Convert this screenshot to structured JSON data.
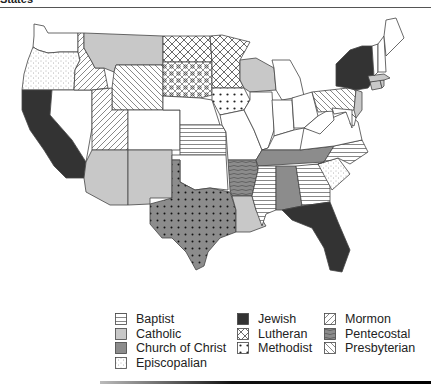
{
  "page": {
    "caption_fragment": "States"
  },
  "colors": {
    "Baptist": "#ffffff",
    "Catholic": "#c8c8c8",
    "Church of Christ": "#8c8c8c",
    "Episcopalian": "#ffffff",
    "Jewish": "#333333",
    "Lutheran": "#ffffff",
    "Methodist": "#ffffff",
    "Mormon": "#ffffff",
    "Pentecostal": "#8c8c8c",
    "Presbyterian": "#ffffff",
    "None": "#ffffff",
    "outline": "#444444"
  },
  "legend": {
    "columns": [
      [
        {
          "label": "Baptist",
          "key": "Baptist"
        },
        {
          "label": "Catholic",
          "key": "Catholic"
        },
        {
          "label": "Church of Christ",
          "key": "Church of Christ"
        },
        {
          "label": "Episcopalian",
          "key": "Episcopalian"
        }
      ],
      [
        {
          "label": "Jewish",
          "key": "Jewish"
        },
        {
          "label": "Lutheran",
          "key": "Lutheran"
        },
        {
          "label": "Methodist",
          "key": "Methodist"
        }
      ],
      [
        {
          "label": "Mormon",
          "key": "Mormon"
        },
        {
          "label": "Pentecostal",
          "key": "Pentecostal"
        },
        {
          "label": "Presbyterian",
          "key": "Presbyterian"
        }
      ]
    ]
  },
  "states": {
    "WA": "None",
    "OR": "Episcopalian",
    "CA": "Jewish",
    "NV": "None",
    "ID": "Mormon",
    "MT": "Catholic",
    "WY": "Presbyterian",
    "UT": "Mormon",
    "AZ": "Catholic",
    "CO": "None",
    "NM": "Catholic",
    "ND": "Lutheran",
    "SD": "Methodist",
    "NE": "None",
    "KS": "Baptist",
    "OK": "None",
    "TX": "Methodist",
    "MN": "Lutheran",
    "IA": "Methodist",
    "MO": "None",
    "AR": "Pentecostal",
    "LA": "Catholic",
    "WI": "Catholic",
    "IL": "None",
    "MI": "None",
    "IN": "None",
    "OH": "None",
    "KY": "None",
    "TN": "Church of Christ",
    "MS": "Baptist",
    "AL": "Church of Christ",
    "GA": "Baptist",
    "FL": "Jewish",
    "SC": "Episcopalian",
    "NC": "Baptist",
    "VA": "None",
    "WV": "None",
    "PA": "Presbyterian",
    "NY": "Jewish",
    "NJ": "Catholic",
    "DE": "None",
    "MD": "None",
    "CT": "Catholic",
    "RI": "Catholic",
    "MA": "Catholic",
    "VT": "None",
    "NH": "None",
    "ME": "None"
  }
}
